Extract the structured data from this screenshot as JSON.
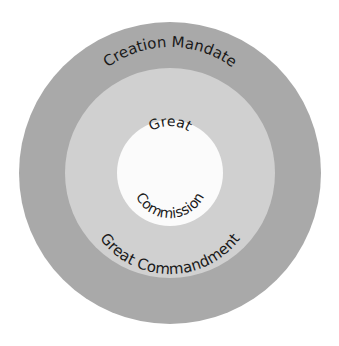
{
  "diagram": {
    "type": "concentric-circles",
    "rings": [
      {
        "name": "outer",
        "label": "Creation Mandate",
        "color": "#a9a9a9"
      },
      {
        "name": "middle",
        "label": "Great Commandment",
        "color": "#d0d0d0"
      },
      {
        "name": "inner",
        "label_top": "Great",
        "label_bottom": "Commission",
        "color": "#fbfbfb"
      }
    ]
  }
}
